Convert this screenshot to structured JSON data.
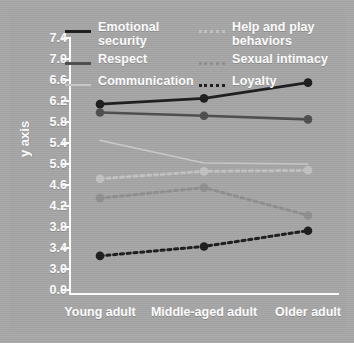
{
  "chart_data": {
    "type": "line",
    "title": "",
    "xlabel": "",
    "ylabel": "y axis",
    "categories": [
      "Young adult",
      "Middle-aged adult",
      "Older adult"
    ],
    "yticks": [
      "7.4",
      "7.0",
      "6.6",
      "6.2",
      "5.8",
      "5.4",
      "5.0",
      "4.6",
      "4.2",
      "3.8",
      "3.4",
      "3.0",
      "0.0"
    ],
    "ylim": [
      3.0,
      7.4
    ],
    "axis_break": true,
    "grid": false,
    "legend_position": "top",
    "series": [
      {
        "name": "Emotional security",
        "values": [
          6.14,
          6.25,
          6.55
        ],
        "style": "solid",
        "color": "#1c1c1c",
        "marker": true
      },
      {
        "name": "Respect",
        "values": [
          5.98,
          5.92,
          5.85
        ],
        "style": "solid",
        "color": "#4d4d4d",
        "marker": true
      },
      {
        "name": "Communication",
        "values": [
          5.45,
          5.02,
          5.0
        ],
        "style": "solid",
        "color": "#c9c9c9",
        "marker": false
      },
      {
        "name": "Help and play behaviors",
        "values": [
          4.72,
          4.86,
          4.88
        ],
        "style": "dotted",
        "color": "#c2c2c2",
        "marker": true
      },
      {
        "name": "Sexual intimacy",
        "values": [
          4.35,
          4.55,
          4.02
        ],
        "style": "dotted",
        "color": "#8f8f8f",
        "marker": true
      },
      {
        "name": "Loyalty",
        "values": [
          3.25,
          3.43,
          3.73
        ],
        "style": "dotted",
        "color": "#1c1c1c",
        "marker": true
      }
    ]
  },
  "legend": {
    "left_column": [
      {
        "label": "Emotional security",
        "swatch": "solid-dark"
      },
      {
        "label": "Respect",
        "swatch": "solid-mid"
      },
      {
        "label": "Communication",
        "swatch": "solid-pale"
      }
    ],
    "right_column": [
      {
        "label": "Help and play behaviors",
        "swatch": "dash-pale"
      },
      {
        "label": "Sexual intimacy",
        "swatch": "dash-mid"
      },
      {
        "label": "Loyalty",
        "swatch": "dash-dark"
      }
    ]
  },
  "colors": {
    "background": "#a6a6a6",
    "axis": "#ffffff",
    "text": "#ffffff"
  }
}
